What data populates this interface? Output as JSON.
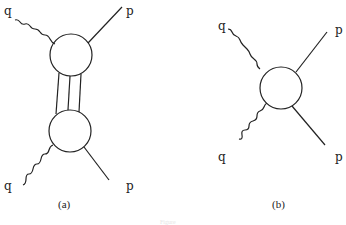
{
  "figure": {
    "caption": "Figure",
    "panels": [
      {
        "id": "a",
        "label": "(a)",
        "labels": {
          "q_top": "q",
          "p_top": "p",
          "q_bottom": "q",
          "p_bottom": "p"
        },
        "blobs": 2,
        "rungs": 3
      },
      {
        "id": "b",
        "label": "(b)",
        "labels": {
          "q_top": "q",
          "p_top": "p",
          "q_bottom": "q",
          "p_bottom": "p"
        },
        "blobs": 1
      }
    ]
  }
}
